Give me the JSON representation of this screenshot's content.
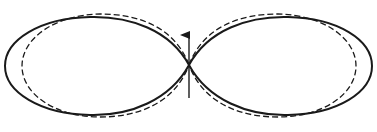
{
  "diagram": {
    "type": "radiation-pattern",
    "colors": {
      "stroke": "#1a1a1a",
      "background": "#ffffff"
    },
    "center": {
      "x": 189,
      "y": 65
    },
    "arrow": {
      "x": 189,
      "y_tail": 98,
      "y_tip": 33,
      "direction": "up"
    },
    "solid_pattern": {
      "style": "solid",
      "left_lobe_extent_x": 5,
      "right_lobe_extent_x": 372,
      "top_y": 16,
      "bottom_y": 115
    },
    "dashed_pattern": {
      "style": "dashed",
      "left_lobe_extent_x": 22,
      "right_lobe_extent_x": 356,
      "top_y": 14,
      "bottom_y": 117
    }
  }
}
